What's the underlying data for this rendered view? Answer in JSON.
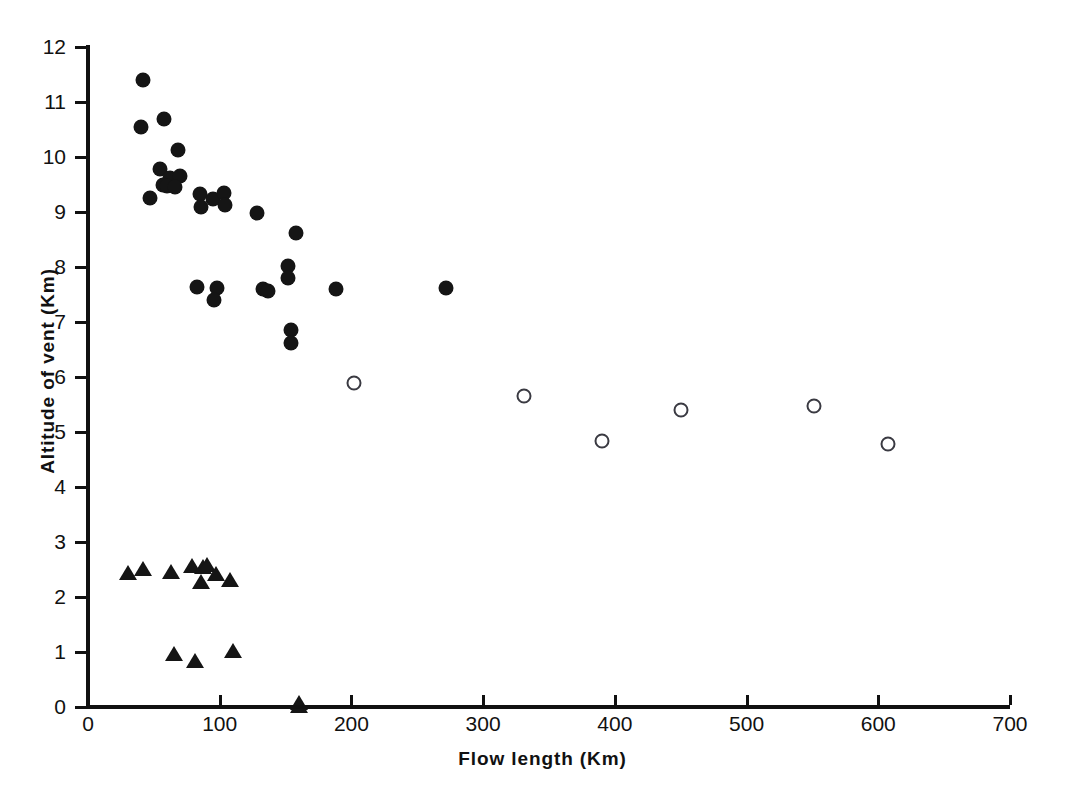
{
  "chart_data": {
    "type": "scatter",
    "title": "",
    "xlabel": "Flow  length  (Km)",
    "ylabel": "Altitude of  vent   (Km)",
    "xlim": [
      0,
      700
    ],
    "ylim": [
      0,
      12
    ],
    "xticks": [
      0,
      100,
      200,
      300,
      400,
      500,
      600,
      700
    ],
    "yticks": [
      0,
      1,
      2,
      3,
      4,
      5,
      6,
      7,
      8,
      9,
      10,
      11,
      12
    ],
    "grid": false,
    "legend": null,
    "series": [
      {
        "name": "filled-circle",
        "marker": "filled circle",
        "color": "#151515",
        "points": [
          [
            42,
            11.4
          ],
          [
            40,
            10.55
          ],
          [
            58,
            10.7
          ],
          [
            68,
            10.12
          ],
          [
            55,
            9.78
          ],
          [
            62,
            9.62
          ],
          [
            70,
            9.66
          ],
          [
            57,
            9.5
          ],
          [
            60,
            9.48
          ],
          [
            66,
            9.45
          ],
          [
            47,
            9.26
          ],
          [
            85,
            9.32
          ],
          [
            95,
            9.24
          ],
          [
            86,
            9.1
          ],
          [
            103,
            9.35
          ],
          [
            104,
            9.12
          ],
          [
            128,
            8.98
          ],
          [
            158,
            8.62
          ],
          [
            83,
            7.63
          ],
          [
            98,
            7.62
          ],
          [
            96,
            7.4
          ],
          [
            133,
            7.6
          ],
          [
            137,
            7.57
          ],
          [
            152,
            8.02
          ],
          [
            152,
            7.8
          ],
          [
            188,
            7.6
          ],
          [
            272,
            7.62
          ],
          [
            154,
            6.86
          ],
          [
            154,
            6.62
          ]
        ]
      },
      {
        "name": "open-circle",
        "marker": "open circle",
        "color": "#3a3a42",
        "points": [
          [
            202,
            5.9
          ],
          [
            331,
            5.66
          ],
          [
            390,
            4.84
          ],
          [
            450,
            5.4
          ],
          [
            551,
            5.48
          ],
          [
            607,
            4.78
          ]
        ]
      },
      {
        "name": "filled-triangle",
        "marker": "filled triangle",
        "color": "#151515",
        "points": [
          [
            30,
            2.42
          ],
          [
            42,
            2.5
          ],
          [
            63,
            2.44
          ],
          [
            79,
            2.55
          ],
          [
            87,
            2.52
          ],
          [
            90,
            2.56
          ],
          [
            86,
            2.26
          ],
          [
            97,
            2.4
          ],
          [
            108,
            2.3
          ],
          [
            65,
            0.95
          ],
          [
            81,
            0.82
          ],
          [
            110,
            1.0
          ],
          [
            160,
            0.05
          ],
          [
            160,
            0.0
          ]
        ]
      }
    ]
  },
  "axis": {
    "x_tick_labels": [
      "0",
      "100",
      "200",
      "300",
      "400",
      "500",
      "600",
      "700"
    ],
    "y_tick_labels": [
      "0",
      "1",
      "2",
      "3",
      "4",
      "5",
      "6",
      "7",
      "8",
      "9",
      "10",
      "11",
      "12"
    ],
    "x_title": "Flow  length  (Km)",
    "y_title": "Altitude of  vent   (Km)"
  }
}
